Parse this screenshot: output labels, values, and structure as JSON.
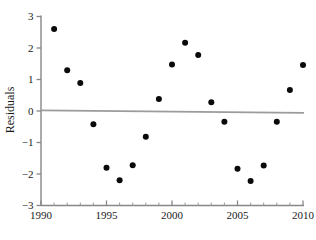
{
  "chart_data": {
    "type": "scatter",
    "title": "",
    "xlabel": "",
    "ylabel": "Residuals",
    "xlim": [
      1990,
      2010
    ],
    "ylim": [
      -3,
      3
    ],
    "grid": false,
    "legend": null,
    "x_ticks_major": [
      "1990",
      "1995",
      "2000",
      "2005",
      "2010"
    ],
    "x_ticks_major_values": [
      1990,
      1995,
      2000,
      2005,
      2010
    ],
    "x_ticks_minor_values": [
      1991,
      1992,
      1993,
      1994,
      1996,
      1997,
      1998,
      1999,
      2001,
      2002,
      2003,
      2004,
      2006,
      2007,
      2008,
      2009
    ],
    "y_ticks": [
      "3",
      "2",
      "1",
      "0",
      "−1",
      "−2",
      "−3"
    ],
    "y_ticks_values": [
      3,
      2,
      1,
      0,
      -1,
      -2,
      -3
    ],
    "x": [
      1991,
      1992,
      1993,
      1994,
      1995,
      1996,
      1997,
      1998,
      1999,
      2000,
      2001,
      2002,
      2003,
      2004,
      2005,
      2006,
      2007,
      2008,
      2009,
      2010
    ],
    "y": [
      2.6,
      1.29,
      0.89,
      -0.42,
      -1.8,
      -2.2,
      -1.72,
      -0.82,
      0.38,
      1.48,
      2.17,
      1.78,
      0.28,
      -0.34,
      -1.83,
      -2.22,
      -1.73,
      -0.34,
      0.67,
      1.46
    ],
    "points": [
      {
        "x": 1991,
        "y": 2.6
      },
      {
        "x": 1992,
        "y": 1.29
      },
      {
        "x": 1993,
        "y": 0.89
      },
      {
        "x": 1994,
        "y": -0.42
      },
      {
        "x": 1995,
        "y": -1.8
      },
      {
        "x": 1996,
        "y": -2.2
      },
      {
        "x": 1997,
        "y": -1.72
      },
      {
        "x": 1998,
        "y": -0.82
      },
      {
        "x": 1999,
        "y": 0.38
      },
      {
        "x": 2000,
        "y": 1.48
      },
      {
        "x": 2001,
        "y": 2.17
      },
      {
        "x": 2002,
        "y": 1.78
      },
      {
        "x": 2003,
        "y": 0.28
      },
      {
        "x": 2004,
        "y": -0.34
      },
      {
        "x": 2005,
        "y": -1.83
      },
      {
        "x": 2006,
        "y": -2.22
      },
      {
        "x": 2007,
        "y": -1.73
      },
      {
        "x": 2008,
        "y": -0.34
      },
      {
        "x": 2009,
        "y": 0.67
      },
      {
        "x": 2010,
        "y": 1.46
      }
    ],
    "reference_line": {
      "name": "zero-residual-line",
      "y_start": 0.02,
      "y_end": -0.06,
      "color": "#9b9b9b"
    },
    "marker": {
      "shape": "circle",
      "color": "#0a0a0a",
      "size_px": 3.0
    },
    "axis_color": "#878787"
  }
}
